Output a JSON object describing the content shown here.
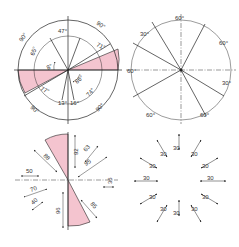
{
  "figure": {
    "colors": {
      "line": "#222222",
      "highlight": "#f4c4cf",
      "background": "#ffffff"
    },
    "panels": [
      {
        "id": "angular-dims-circle",
        "position": "top-left",
        "labels": [
          "90°",
          "47°",
          "90°",
          "65°",
          "71°",
          "8°",
          "86°",
          "77°",
          "74°",
          "90°",
          "13°",
          "16°",
          "90°"
        ]
      },
      {
        "id": "angular-dims-equal",
        "position": "top-right",
        "labels": [
          "60°",
          "30°",
          "60°",
          "60°",
          "30°",
          "60°",
          "60°"
        ]
      },
      {
        "id": "linear-dims-sector",
        "position": "bottom-left",
        "labels": [
          "92",
          "88",
          "63",
          "95",
          "50",
          "36",
          "70",
          "40",
          "96",
          "85"
        ]
      },
      {
        "id": "linear-dims-radial",
        "position": "bottom-right",
        "labels": [
          "30",
          "30",
          "30",
          "30",
          "30",
          "30",
          "30",
          "30",
          "30",
          "30",
          "30",
          "30"
        ]
      }
    ]
  }
}
